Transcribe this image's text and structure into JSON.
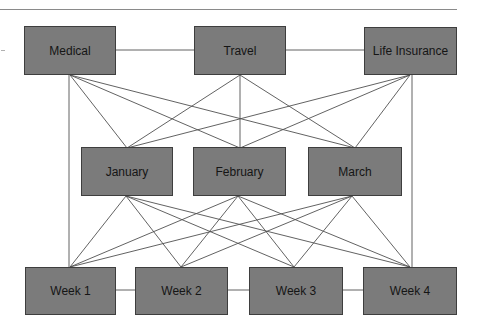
{
  "diagram": {
    "type": "layered-network",
    "colors": {
      "node_fill": "#7b7b7b",
      "node_border": "#3e3e3e",
      "edge": "#505050",
      "text": "#151515"
    },
    "layers": [
      {
        "name": "categories",
        "nodes": [
          {
            "id": "medical",
            "label": "Medical"
          },
          {
            "id": "travel",
            "label": "Travel"
          },
          {
            "id": "life",
            "label": "Life Insurance"
          }
        ]
      },
      {
        "name": "months",
        "nodes": [
          {
            "id": "jan",
            "label": "January"
          },
          {
            "id": "feb",
            "label": "February"
          },
          {
            "id": "mar",
            "label": "March"
          }
        ]
      },
      {
        "name": "weeks",
        "nodes": [
          {
            "id": "w1",
            "label": "Week 1"
          },
          {
            "id": "w2",
            "label": "Week 2"
          },
          {
            "id": "w3",
            "label": "Week 3"
          },
          {
            "id": "w4",
            "label": "Week 4"
          }
        ]
      }
    ],
    "edges": [
      [
        "medical",
        "travel"
      ],
      [
        "travel",
        "life"
      ],
      [
        "medical",
        "jan"
      ],
      [
        "medical",
        "feb"
      ],
      [
        "medical",
        "mar"
      ],
      [
        "travel",
        "jan"
      ],
      [
        "travel",
        "feb"
      ],
      [
        "travel",
        "mar"
      ],
      [
        "life",
        "jan"
      ],
      [
        "life",
        "feb"
      ],
      [
        "life",
        "mar"
      ],
      [
        "medical",
        "w1"
      ],
      [
        "life",
        "w4"
      ],
      [
        "jan",
        "w1"
      ],
      [
        "jan",
        "w2"
      ],
      [
        "jan",
        "w3"
      ],
      [
        "jan",
        "w4"
      ],
      [
        "feb",
        "w1"
      ],
      [
        "feb",
        "w2"
      ],
      [
        "feb",
        "w3"
      ],
      [
        "feb",
        "w4"
      ],
      [
        "mar",
        "w1"
      ],
      [
        "mar",
        "w2"
      ],
      [
        "mar",
        "w3"
      ],
      [
        "mar",
        "w4"
      ],
      [
        "w1",
        "w2"
      ],
      [
        "w2",
        "w3"
      ],
      [
        "w3",
        "w4"
      ]
    ]
  }
}
